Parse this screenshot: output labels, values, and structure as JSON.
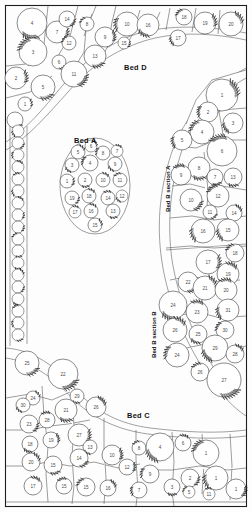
{
  "plan": {
    "title": "Garden Planting Plan",
    "canvas": {
      "width": 252,
      "height": 512
    },
    "background_color": "#fdfdfd",
    "outline_color": "#1e1e1e",
    "shrub_fill": "#ffffff",
    "shrub_stroke": "#2b2b2b",
    "number_color": "#4a4a4a"
  },
  "labels": {
    "bed_a": {
      "text": "Bed A",
      "lead": "B",
      "rest": "ED ",
      "tail": "A",
      "x": 74,
      "y": 131
    },
    "bed_c": {
      "text": "Bed C",
      "x": 127,
      "y": 407
    },
    "bed_d": {
      "text": "Bed D",
      "x": 124,
      "y": 59
    },
    "bed_b_section_a": {
      "text": "Bed B section A",
      "x": 162,
      "y": 200
    },
    "bed_b_section_b": {
      "text": "Bed B section B",
      "x": 148,
      "y": 345
    }
  },
  "beds": {
    "bed_d": {
      "name": "Bed D",
      "plants": [
        {
          "n": "4",
          "x": 32,
          "y": 23,
          "r": 15
        },
        {
          "n": "7",
          "x": 57,
          "y": 32,
          "r": 11
        },
        {
          "n": "14",
          "x": 67,
          "y": 19,
          "r": 8
        },
        {
          "n": "8",
          "x": 87,
          "y": 24,
          "r": 7
        },
        {
          "n": "12",
          "x": 69,
          "y": 43,
          "r": 7
        },
        {
          "n": "3",
          "x": 33,
          "y": 52,
          "r": 14
        },
        {
          "n": "6",
          "x": 59,
          "y": 62,
          "r": 7
        },
        {
          "n": "11",
          "x": 74,
          "y": 74,
          "r": 13
        },
        {
          "n": "13",
          "x": 95,
          "y": 56,
          "r": 11
        },
        {
          "n": "9",
          "x": 105,
          "y": 37,
          "r": 10
        },
        {
          "n": "15",
          "x": 124,
          "y": 43,
          "r": 6
        },
        {
          "n": "10",
          "x": 127,
          "y": 24,
          "r": 12
        },
        {
          "n": "16",
          "x": 148,
          "y": 25,
          "r": 11
        },
        {
          "n": "17",
          "x": 178,
          "y": 38,
          "r": 8
        },
        {
          "n": "18",
          "x": 184,
          "y": 17,
          "r": 8
        },
        {
          "n": "19",
          "x": 205,
          "y": 23,
          "r": 11
        },
        {
          "n": "20",
          "x": 231,
          "y": 24,
          "r": 12
        },
        {
          "n": "2",
          "x": 16,
          "y": 78,
          "r": 11
        },
        {
          "n": "5",
          "x": 43,
          "y": 87,
          "r": 12
        },
        {
          "n": "1",
          "x": 25,
          "y": 104,
          "r": 7
        },
        {
          "n": "",
          "x": 15,
          "y": 120,
          "r": 8
        }
      ]
    },
    "bed_a": {
      "name": "Bed A",
      "plants": [
        {
          "n": "6",
          "x": 91,
          "y": 146,
          "r": 6
        },
        {
          "n": "5",
          "x": 78,
          "y": 152,
          "r": 7
        },
        {
          "n": "8",
          "x": 103,
          "y": 153,
          "r": 7
        },
        {
          "n": "7",
          "x": 117,
          "y": 151,
          "r": 6
        },
        {
          "n": "3",
          "x": 72,
          "y": 165,
          "r": 7
        },
        {
          "n": "4",
          "x": 90,
          "y": 163,
          "r": 8
        },
        {
          "n": "9",
          "x": 115,
          "y": 164,
          "r": 7
        },
        {
          "n": "1",
          "x": 67,
          "y": 181,
          "r": 7
        },
        {
          "n": "2",
          "x": 85,
          "y": 180,
          "r": 7
        },
        {
          "n": "10",
          "x": 103,
          "y": 180,
          "r": 7
        },
        {
          "n": "11",
          "x": 120,
          "y": 180,
          "r": 7
        },
        {
          "n": "19",
          "x": 72,
          "y": 198,
          "r": 7
        },
        {
          "n": "18",
          "x": 89,
          "y": 196,
          "r": 7
        },
        {
          "n": "14",
          "x": 108,
          "y": 198,
          "r": 7
        },
        {
          "n": "12",
          "x": 122,
          "y": 196,
          "r": 6
        },
        {
          "n": "17",
          "x": 75,
          "y": 212,
          "r": 6
        },
        {
          "n": "16",
          "x": 91,
          "y": 211,
          "r": 7
        },
        {
          "n": "13",
          "x": 113,
          "y": 211,
          "r": 7
        },
        {
          "n": "15",
          "x": 95,
          "y": 225,
          "r": 7
        }
      ]
    },
    "bed_b_section_a": {
      "name": "Bed B section A",
      "plants": [
        {
          "n": "1",
          "x": 222,
          "y": 95,
          "r": 16
        },
        {
          "n": "2",
          "x": 208,
          "y": 112,
          "r": 10
        },
        {
          "n": "3",
          "x": 233,
          "y": 123,
          "r": 10
        },
        {
          "n": "4",
          "x": 202,
          "y": 132,
          "r": 12
        },
        {
          "n": "5",
          "x": 182,
          "y": 140,
          "r": 10
        },
        {
          "n": "6",
          "x": 222,
          "y": 151,
          "r": 15
        },
        {
          "n": "8",
          "x": 199,
          "y": 168,
          "r": 11
        },
        {
          "n": "9",
          "x": 181,
          "y": 175,
          "r": 10
        },
        {
          "n": "7",
          "x": 215,
          "y": 177,
          "r": 8
        },
        {
          "n": "13",
          "x": 233,
          "y": 177,
          "r": 9
        },
        {
          "n": "10",
          "x": 191,
          "y": 200,
          "r": 11
        },
        {
          "n": "12",
          "x": 218,
          "y": 196,
          "r": 11
        },
        {
          "n": "11",
          "x": 210,
          "y": 212,
          "r": 7
        },
        {
          "n": "14",
          "x": 234,
          "y": 213,
          "r": 8
        },
        {
          "n": "16",
          "x": 203,
          "y": 231,
          "r": 12
        },
        {
          "n": "15",
          "x": 228,
          "y": 230,
          "r": 11
        }
      ]
    },
    "bed_b_section_b": {
      "name": "Bed B section B",
      "plants": [
        {
          "n": "18",
          "x": 235,
          "y": 253,
          "r": 9
        },
        {
          "n": "17",
          "x": 208,
          "y": 262,
          "r": 12
        },
        {
          "n": "19",
          "x": 228,
          "y": 274,
          "r": 11
        },
        {
          "n": "22",
          "x": 188,
          "y": 282,
          "r": 10
        },
        {
          "n": "21",
          "x": 205,
          "y": 288,
          "r": 12
        },
        {
          "n": "20",
          "x": 226,
          "y": 290,
          "r": 11
        },
        {
          "n": "24",
          "x": 173,
          "y": 305,
          "r": 14
        },
        {
          "n": "23",
          "x": 197,
          "y": 312,
          "r": 11
        },
        {
          "n": "31",
          "x": 228,
          "y": 310,
          "r": 11
        },
        {
          "n": "30",
          "x": 225,
          "y": 330,
          "r": 9
        },
        {
          "n": "26",
          "x": 175,
          "y": 330,
          "r": 12
        },
        {
          "n": "25",
          "x": 198,
          "y": 334,
          "r": 9
        },
        {
          "n": "29",
          "x": 215,
          "y": 348,
          "r": 13
        },
        {
          "n": "28",
          "x": 235,
          "y": 354,
          "r": 9
        },
        {
          "n": "24",
          "x": 177,
          "y": 355,
          "r": 12
        },
        {
          "n": "26",
          "x": 200,
          "y": 372,
          "r": 9
        },
        {
          "n": "27",
          "x": 224,
          "y": 380,
          "r": 17
        }
      ]
    },
    "bed_c": {
      "name": "Bed C",
      "plants": [
        {
          "n": "25",
          "x": 27,
          "y": 363,
          "r": 12
        },
        {
          "n": "22",
          "x": 63,
          "y": 374,
          "r": 15
        },
        {
          "n": "29",
          "x": 77,
          "y": 396,
          "r": 7
        },
        {
          "n": "24",
          "x": 33,
          "y": 398,
          "r": 7
        },
        {
          "n": "30",
          "x": 23,
          "y": 405,
          "r": 7
        },
        {
          "n": "21",
          "x": 66,
          "y": 410,
          "r": 11
        },
        {
          "n": "26",
          "x": 96,
          "y": 407,
          "r": 10
        },
        {
          "n": "23",
          "x": 29,
          "y": 424,
          "r": 9
        },
        {
          "n": "28",
          "x": 47,
          "y": 420,
          "r": 8
        },
        {
          "n": "19",
          "x": 51,
          "y": 440,
          "r": 8
        },
        {
          "n": "18",
          "x": 30,
          "y": 444,
          "r": 8
        },
        {
          "n": "27",
          "x": 79,
          "y": 435,
          "r": 11
        },
        {
          "n": "13",
          "x": 90,
          "y": 447,
          "r": 7
        },
        {
          "n": "20",
          "x": 31,
          "y": 462,
          "r": 9
        },
        {
          "n": "15",
          "x": 53,
          "y": 465,
          "r": 9
        },
        {
          "n": "14",
          "x": 79,
          "y": 458,
          "r": 9
        },
        {
          "n": "10",
          "x": 112,
          "y": 455,
          "r": 10
        },
        {
          "n": "12",
          "x": 127,
          "y": 467,
          "r": 8
        },
        {
          "n": "17",
          "x": 33,
          "y": 486,
          "r": 9
        },
        {
          "n": "15",
          "x": 64,
          "y": 486,
          "r": 8
        },
        {
          "n": "15",
          "x": 86,
          "y": 487,
          "r": 9
        },
        {
          "n": "16",
          "x": 108,
          "y": 488,
          "r": 8
        },
        {
          "n": "7",
          "x": 139,
          "y": 490,
          "r": 8
        },
        {
          "n": "8",
          "x": 139,
          "y": 448,
          "r": 7
        },
        {
          "n": "4",
          "x": 160,
          "y": 447,
          "r": 14
        },
        {
          "n": "9",
          "x": 150,
          "y": 474,
          "r": 9
        },
        {
          "n": "6",
          "x": 183,
          "y": 443,
          "r": 8
        },
        {
          "n": "3",
          "x": 172,
          "y": 487,
          "r": 8
        },
        {
          "n": "2",
          "x": 190,
          "y": 478,
          "r": 9
        },
        {
          "n": "5",
          "x": 189,
          "y": 492,
          "r": 6
        },
        {
          "n": "1",
          "x": 206,
          "y": 453,
          "r": 13
        },
        {
          "n": "1",
          "x": 216,
          "y": 478,
          "r": 12
        },
        {
          "n": "11",
          "x": 209,
          "y": 494,
          "r": 6
        },
        {
          "n": "1",
          "x": 236,
          "y": 489,
          "r": 10
        }
      ]
    },
    "left_border": {
      "name": "left border strip",
      "plants": [
        {
          "n": "",
          "x": 18,
          "y": 131,
          "r": 6
        },
        {
          "n": "",
          "x": 18,
          "y": 143,
          "r": 6
        },
        {
          "n": "",
          "x": 18,
          "y": 155,
          "r": 6
        },
        {
          "n": "",
          "x": 18,
          "y": 167,
          "r": 6
        },
        {
          "n": "",
          "x": 18,
          "y": 179,
          "r": 6
        },
        {
          "n": "",
          "x": 18,
          "y": 191,
          "r": 6
        },
        {
          "n": "",
          "x": 18,
          "y": 203,
          "r": 6
        },
        {
          "n": "",
          "x": 18,
          "y": 215,
          "r": 6
        },
        {
          "n": "",
          "x": 18,
          "y": 227,
          "r": 6
        },
        {
          "n": "",
          "x": 18,
          "y": 239,
          "r": 6
        },
        {
          "n": "",
          "x": 18,
          "y": 251,
          "r": 6
        },
        {
          "n": "",
          "x": 18,
          "y": 263,
          "r": 6
        },
        {
          "n": "",
          "x": 18,
          "y": 275,
          "r": 6
        },
        {
          "n": "",
          "x": 18,
          "y": 287,
          "r": 6
        },
        {
          "n": "",
          "x": 18,
          "y": 299,
          "r": 6
        },
        {
          "n": "",
          "x": 18,
          "y": 311,
          "r": 6
        },
        {
          "n": "",
          "x": 18,
          "y": 323,
          "r": 6
        },
        {
          "n": "",
          "x": 18,
          "y": 335,
          "r": 6
        }
      ]
    }
  },
  "regions": {
    "bed_d_subplots": [
      "M 6 6 L 246 6 L 246 42 L 150 30 L 100 52 L 56 92 L 30 126 L 6 140 Z"
    ],
    "lawn": "M 6 140 L 30 126 L 56 92 L 100 52 L 150 30 L 246 42 L 246 460 L 6 460 Z",
    "bed_b_edge": "M 246 70 L 176 150 L 160 230 L 168 300 L 200 390 L 246 420 Z",
    "bed_c_edge": "M 6 346 L 60 350 L 110 400 L 180 420 L 246 432 L 246 506 L 6 506 Z"
  }
}
